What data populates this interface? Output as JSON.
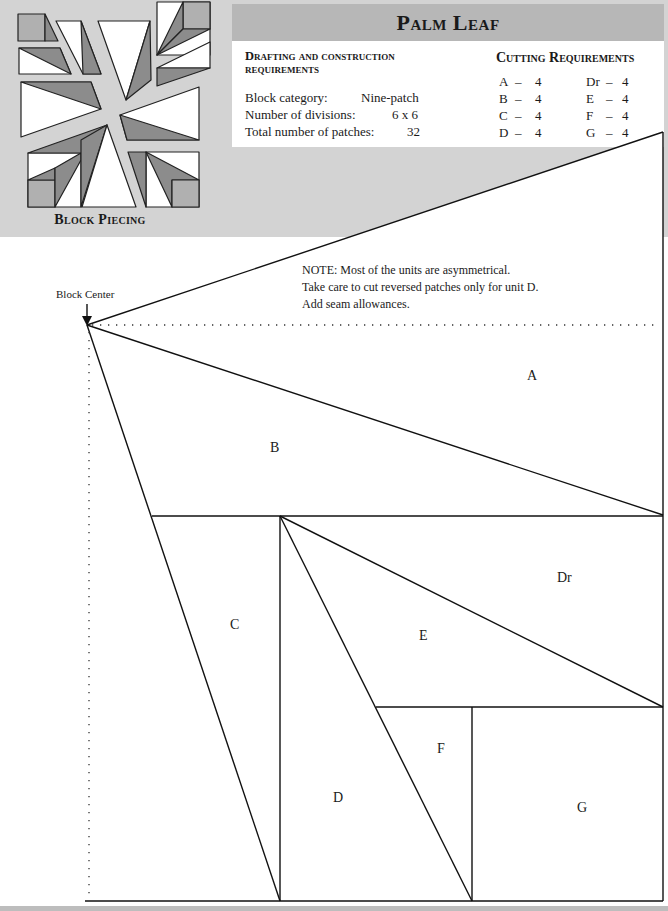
{
  "title": "Palm Leaf",
  "block_piecing": {
    "caption": "Block Piecing"
  },
  "drafting": {
    "heading": "Drafting and construction requirements",
    "specs": [
      {
        "label": "Block category:",
        "value": "Nine-patch"
      },
      {
        "label": "Number of divisions:",
        "value": "6 x 6"
      },
      {
        "label": "Total number of patches:",
        "value": "32"
      }
    ]
  },
  "cutting": {
    "heading": "Cutting Requirements",
    "items": [
      {
        "unit": "A",
        "dash": "–",
        "qty": "4"
      },
      {
        "unit": "B",
        "dash": "–",
        "qty": "4"
      },
      {
        "unit": "C",
        "dash": "–",
        "qty": "4"
      },
      {
        "unit": "D",
        "dash": "–",
        "qty": "4"
      },
      {
        "unit": "Dr",
        "dash": "–",
        "qty": "4"
      },
      {
        "unit": "E",
        "dash": "–",
        "qty": "4"
      },
      {
        "unit": "F",
        "dash": "–",
        "qty": "4"
      },
      {
        "unit": "G",
        "dash": "–",
        "qty": "4"
      }
    ]
  },
  "note": {
    "lines": [
      "NOTE: Most of the units are asymmetrical.",
      "Take care to cut reversed patches only for unit D.",
      "Add seam allowances."
    ]
  },
  "diagram": {
    "block_center_label": "Block Center",
    "patch_labels": [
      "A",
      "B",
      "C",
      "D",
      "Dr",
      "E",
      "F",
      "G"
    ]
  },
  "colors": {
    "band_gray": "#d3d3d3",
    "title_gray": "#b7b7b7",
    "patch_dark": "#8c8c8c",
    "patch_mid": "#b0b0b0"
  }
}
